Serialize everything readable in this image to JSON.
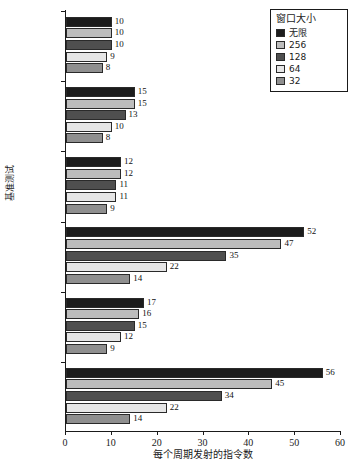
{
  "chart_data": {
    "type": "bar",
    "orientation": "horizontal",
    "title": "",
    "xlabel": "每个周期发射的指令数",
    "ylabel": "基准测试",
    "categories": [
      "gcc",
      "espresso",
      "li",
      "fpppp",
      "doduc",
      "tomcatv"
    ],
    "series": [
      {
        "name": "无限",
        "color": "#1c1c1c",
        "values": [
          10,
          15,
          12,
          52,
          17,
          56
        ]
      },
      {
        "name": "256",
        "color": "#bdbdbd",
        "values": [
          10,
          15,
          12,
          47,
          16,
          45
        ]
      },
      {
        "name": "128",
        "color": "#4f4f4f",
        "values": [
          10,
          13,
          11,
          35,
          15,
          34
        ]
      },
      {
        "name": "64",
        "color": "#e6e6e6",
        "values": [
          9,
          10,
          11,
          22,
          12,
          22
        ]
      },
      {
        "name": "32",
        "color": "#8f8f8f",
        "values": [
          8,
          8,
          9,
          14,
          9,
          14
        ]
      }
    ],
    "xlim": [
      0,
      60
    ],
    "xticks": [
      0,
      10,
      20,
      30,
      40,
      50,
      60
    ],
    "xtick_labels": [
      "0",
      "10",
      "20",
      "30",
      "40",
      "50",
      "60"
    ],
    "grid": false,
    "legend": {
      "title": "窗口大小",
      "position": "top-right",
      "entries": [
        {
          "label": "无限",
          "color": "#1c1c1c"
        },
        {
          "label": "256",
          "color": "#bdbdbd"
        },
        {
          "label": "128",
          "color": "#4f4f4f"
        },
        {
          "label": "64",
          "color": "#e6e6e6"
        },
        {
          "label": "32",
          "color": "#8f8f8f"
        }
      ]
    }
  }
}
